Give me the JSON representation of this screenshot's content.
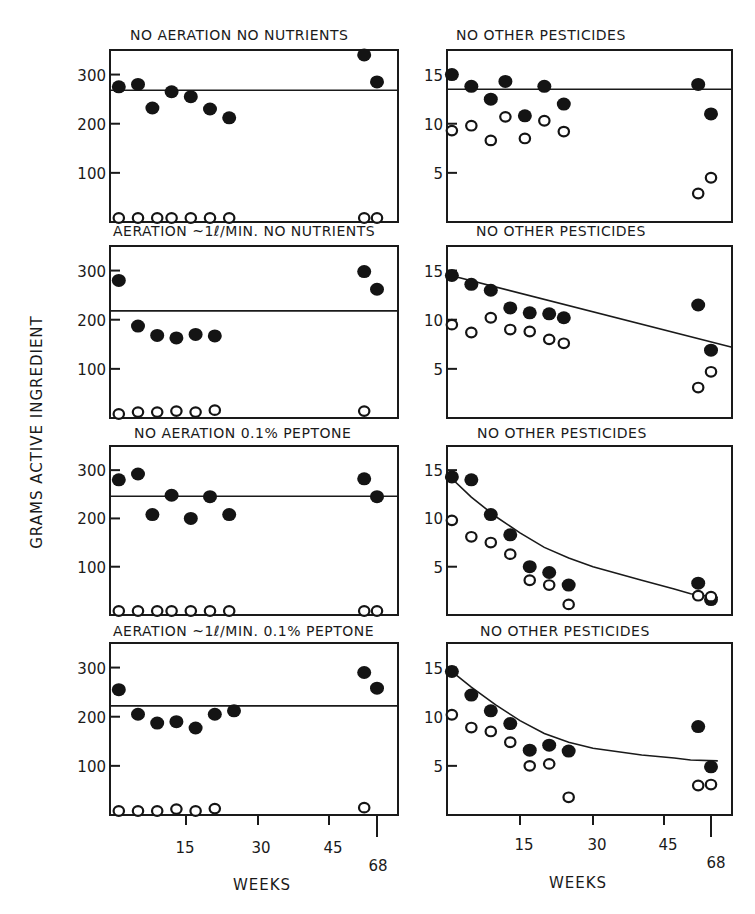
{
  "chart_data": {
    "type": "scatter",
    "ylabel": "GRAMS ACTIVE INGREDIENT",
    "xlabel": "WEEKS",
    "x_ticks": [
      "15",
      "30",
      "45",
      "68"
    ],
    "legend": {
      "filled": "filled circles (active ingredient series)",
      "open": "open circles (second series)"
    },
    "panels": [
      {
        "id": "row1-left",
        "title": "NO AERATION   NO NUTRIENTS",
        "y_ticks": [
          "100",
          "200",
          "300"
        ],
        "ylim": [
          0,
          350
        ],
        "fit": {
          "type": "horizontal",
          "y": 268
        },
        "filled": [
          [
            1,
            275
          ],
          [
            5,
            280
          ],
          [
            8,
            232
          ],
          [
            12,
            265
          ],
          [
            16,
            255
          ],
          [
            20,
            230
          ],
          [
            24,
            212
          ],
          [
            60,
            340
          ],
          [
            64,
            285
          ]
        ],
        "open": [
          [
            1,
            2
          ],
          [
            5,
            2
          ],
          [
            9,
            2
          ],
          [
            12,
            2
          ],
          [
            16,
            2
          ],
          [
            20,
            2
          ],
          [
            24,
            2
          ],
          [
            60,
            4
          ],
          [
            64,
            4
          ]
        ]
      },
      {
        "id": "row1-right",
        "title": "NO OTHER PESTICIDES",
        "y_ticks": [
          "5",
          "10",
          "15"
        ],
        "ylim": [
          0,
          17.5
        ],
        "fit": {
          "type": "horizontal",
          "y": 13.5
        },
        "filled": [
          [
            1,
            15
          ],
          [
            5,
            13.8
          ],
          [
            9,
            12.5
          ],
          [
            12,
            14.3
          ],
          [
            16,
            10.8
          ],
          [
            20,
            13.8
          ],
          [
            24,
            12
          ],
          [
            60,
            14
          ],
          [
            64,
            11
          ]
        ],
        "open": [
          [
            1,
            9.3
          ],
          [
            5,
            9.8
          ],
          [
            9,
            8.3
          ],
          [
            12,
            10.7
          ],
          [
            16,
            8.5
          ],
          [
            20,
            10.3
          ],
          [
            24,
            9.2
          ],
          [
            60,
            2.9
          ],
          [
            64,
            4.5
          ]
        ]
      },
      {
        "id": "row2-left",
        "title": "AERATION ~1ℓ/MIN.   NO NUTRIENTS",
        "y_ticks": [
          "100",
          "200",
          "300"
        ],
        "ylim": [
          0,
          350
        ],
        "fit": {
          "type": "horizontal",
          "y": 218
        },
        "filled": [
          [
            1,
            280
          ],
          [
            5,
            187
          ],
          [
            9,
            168
          ],
          [
            13,
            163
          ],
          [
            17,
            170
          ],
          [
            21,
            167
          ],
          [
            60,
            298
          ],
          [
            64,
            262
          ]
        ],
        "open": [
          [
            1,
            8
          ],
          [
            5,
            12
          ],
          [
            9,
            12
          ],
          [
            13,
            14
          ],
          [
            17,
            12
          ],
          [
            21,
            16
          ],
          [
            60,
            14
          ]
        ]
      },
      {
        "id": "row2-right",
        "title": "NO OTHER PESTICIDES",
        "y_ticks": [
          "5",
          "10",
          "15"
        ],
        "ylim": [
          0,
          17.5
        ],
        "fit": {
          "type": "linear",
          "y0": 14.6,
          "y1": 7.2
        },
        "filled": [
          [
            1,
            14.5
          ],
          [
            5,
            13.6
          ],
          [
            9,
            13
          ],
          [
            13,
            11.2
          ],
          [
            17,
            10.7
          ],
          [
            21,
            10.6
          ],
          [
            24,
            10.2
          ],
          [
            60,
            11.5
          ],
          [
            64,
            6.9
          ]
        ],
        "open": [
          [
            1,
            9.5
          ],
          [
            5,
            8.7
          ],
          [
            9,
            10.2
          ],
          [
            13,
            9
          ],
          [
            17,
            8.8
          ],
          [
            21,
            8
          ],
          [
            24,
            7.6
          ],
          [
            60,
            3.1
          ],
          [
            64,
            4.7
          ]
        ]
      },
      {
        "id": "row3-left",
        "title": "NO AERATION   0.1% PEPTONE",
        "y_ticks": [
          "100",
          "200",
          "300"
        ],
        "ylim": [
          0,
          350
        ],
        "fit": {
          "type": "horizontal",
          "y": 246
        },
        "filled": [
          [
            1,
            280
          ],
          [
            5,
            292
          ],
          [
            8,
            208
          ],
          [
            12,
            248
          ],
          [
            16,
            200
          ],
          [
            20,
            245
          ],
          [
            24,
            208
          ],
          [
            60,
            282
          ],
          [
            64,
            245
          ]
        ],
        "open": [
          [
            1,
            2
          ],
          [
            5,
            2
          ],
          [
            9,
            2
          ],
          [
            12,
            2
          ],
          [
            16,
            2
          ],
          [
            20,
            2
          ],
          [
            24,
            2
          ],
          [
            60,
            4
          ],
          [
            64,
            4
          ]
        ]
      },
      {
        "id": "row3-right",
        "title": "NO OTHER PESTICIDES",
        "y_ticks": [
          "5",
          "10",
          "15"
        ],
        "ylim": [
          0,
          17.5
        ],
        "fit": {
          "type": "exp-decay",
          "points": [
            [
              0,
              14.6
            ],
            [
              5,
              12.2
            ],
            [
              10,
              10.2
            ],
            [
              15,
              8.5
            ],
            [
              20,
              7.0
            ],
            [
              25,
              5.9
            ],
            [
              30,
              5.0
            ],
            [
              40,
              3.6
            ],
            [
              50,
              2.7
            ],
            [
              58,
              2.2
            ],
            [
              66,
              1.8
            ]
          ]
        },
        "filled": [
          [
            1,
            14.3
          ],
          [
            5,
            14
          ],
          [
            9,
            10.4
          ],
          [
            13,
            8.3
          ],
          [
            17,
            5
          ],
          [
            21,
            4.4
          ],
          [
            25,
            3.1
          ],
          [
            60,
            3.3
          ],
          [
            64,
            1.6
          ]
        ],
        "open": [
          [
            1,
            9.8
          ],
          [
            5,
            8.1
          ],
          [
            9,
            7.5
          ],
          [
            13,
            6.3
          ],
          [
            17,
            3.6
          ],
          [
            21,
            3.1
          ],
          [
            25,
            1.1
          ],
          [
            60,
            2
          ],
          [
            64,
            1.9
          ]
        ]
      },
      {
        "id": "row4-left",
        "title": "AERATION ~1ℓ/MIN.   0.1% PEPTONE",
        "y_ticks": [
          "100",
          "200",
          "300"
        ],
        "ylim": [
          0,
          350
        ],
        "fit": {
          "type": "horizontal",
          "y": 222
        },
        "filled": [
          [
            1,
            255
          ],
          [
            5,
            205
          ],
          [
            9,
            187
          ],
          [
            13,
            190
          ],
          [
            17,
            177
          ],
          [
            21,
            205
          ],
          [
            25,
            212
          ],
          [
            60,
            290
          ],
          [
            64,
            258
          ]
        ],
        "open": [
          [
            1,
            6
          ],
          [
            5,
            8
          ],
          [
            9,
            10
          ],
          [
            13,
            12
          ],
          [
            17,
            10
          ],
          [
            21,
            13
          ],
          [
            60,
            15
          ]
        ]
      },
      {
        "id": "row4-right",
        "title": "NO OTHER PESTICIDES",
        "y_ticks": [
          "5",
          "10",
          "15"
        ],
        "ylim": [
          0,
          17.5
        ],
        "fit": {
          "type": "exp-decay",
          "points": [
            [
              0,
              15
            ],
            [
              5,
              13
            ],
            [
              10,
              11.2
            ],
            [
              15,
              9.6
            ],
            [
              20,
              8.3
            ],
            [
              25,
              7.4
            ],
            [
              30,
              6.8
            ],
            [
              40,
              6.1
            ],
            [
              50,
              5.8
            ],
            [
              58,
              5.6
            ],
            [
              66,
              5.5
            ]
          ]
        },
        "filled": [
          [
            1,
            14.6
          ],
          [
            5,
            12.2
          ],
          [
            9,
            10.6
          ],
          [
            13,
            9.3
          ],
          [
            17,
            6.6
          ],
          [
            21,
            7.1
          ],
          [
            25,
            6.5
          ],
          [
            60,
            9
          ],
          [
            64,
            4.9
          ]
        ],
        "open": [
          [
            1,
            10.2
          ],
          [
            5,
            8.9
          ],
          [
            9,
            8.5
          ],
          [
            13,
            7.4
          ],
          [
            17,
            5
          ],
          [
            21,
            5.2
          ],
          [
            25,
            1.8
          ],
          [
            60,
            3
          ],
          [
            64,
            3.1
          ]
        ]
      }
    ]
  },
  "figure": {
    "ylabel": "GRAMS ACTIVE INGREDIENT",
    "xlabel_left": "WEEKS",
    "xlabel_right": "WEEKS",
    "x_tick_labels": [
      "15",
      "30",
      "45",
      "68"
    ],
    "rows": [
      {
        "left_title": "NO AERATION   NO NUTRIENTS",
        "right_title": "NO OTHER PESTICIDES"
      },
      {
        "left_title": "AERATION ~1ℓ/MIN.  NO NUTRIENTS",
        "right_title": "NO OTHER PESTICIDES"
      },
      {
        "left_title": "NO AERATION   0.1% PEPTONE",
        "right_title": "NO OTHER PESTICIDES"
      },
      {
        "left_title": "AERATION ~1ℓ/MIN.   0.1% PEPTONE",
        "right_title": "NO OTHER PESTICIDES"
      }
    ],
    "left_y_ticks": [
      "100",
      "200",
      "300"
    ],
    "right_y_ticks": [
      "5",
      "10",
      "15"
    ]
  }
}
